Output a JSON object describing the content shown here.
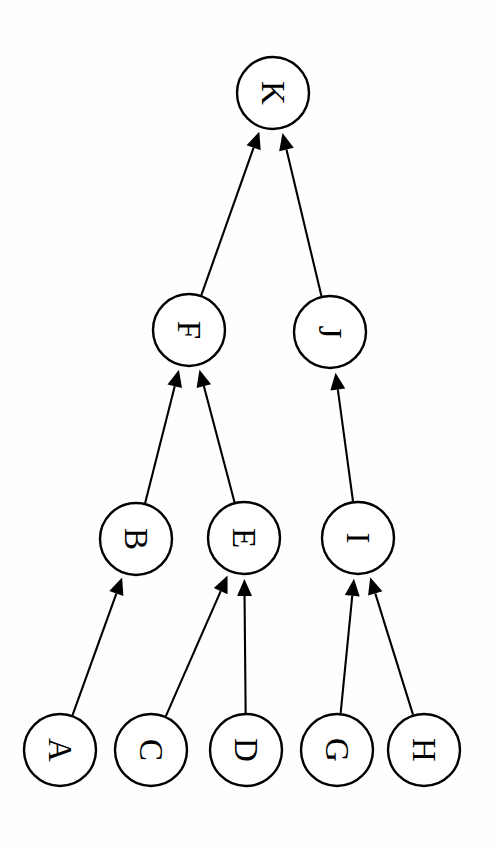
{
  "diagram": {
    "orientation_degrees": 90,
    "background_color": "#fefefe",
    "stroke_color": "#000000",
    "node_fill_color": "#ffffff",
    "node_radius": 36,
    "nodes": [
      {
        "id": "A",
        "label": "A",
        "cx": 60,
        "cy": 750,
        "level": 0
      },
      {
        "id": "C",
        "label": "C",
        "cx": 151,
        "cy": 750,
        "level": 0
      },
      {
        "id": "D",
        "label": "D",
        "cx": 246,
        "cy": 750,
        "level": 0
      },
      {
        "id": "G",
        "label": "G",
        "cx": 337,
        "cy": 750,
        "level": 0
      },
      {
        "id": "H",
        "label": "H",
        "cx": 424,
        "cy": 750,
        "level": 0
      },
      {
        "id": "B",
        "label": "B",
        "cx": 136,
        "cy": 539,
        "level": 1
      },
      {
        "id": "E",
        "label": "E",
        "cx": 244,
        "cy": 538,
        "level": 1
      },
      {
        "id": "I",
        "label": "I",
        "cx": 358,
        "cy": 538,
        "level": 1
      },
      {
        "id": "F",
        "label": "F",
        "cx": 189,
        "cy": 330,
        "level": 2
      },
      {
        "id": "J",
        "label": "J",
        "cx": 330,
        "cy": 332,
        "level": 2
      },
      {
        "id": "K",
        "label": "K",
        "cx": 273,
        "cy": 93,
        "level": 3
      }
    ],
    "edges": [
      {
        "from": "A",
        "to": "B",
        "directed": true
      },
      {
        "from": "C",
        "to": "E",
        "directed": true
      },
      {
        "from": "D",
        "to": "E",
        "directed": true
      },
      {
        "from": "G",
        "to": "I",
        "directed": true
      },
      {
        "from": "H",
        "to": "I",
        "directed": true
      },
      {
        "from": "B",
        "to": "F",
        "directed": true
      },
      {
        "from": "E",
        "to": "F",
        "directed": true
      },
      {
        "from": "I",
        "to": "J",
        "directed": true
      },
      {
        "from": "F",
        "to": "K",
        "directed": true
      },
      {
        "from": "J",
        "to": "K",
        "directed": true
      }
    ]
  }
}
